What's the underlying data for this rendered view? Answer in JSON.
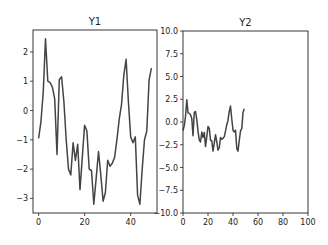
{
  "chart_data": [
    {
      "type": "line",
      "title": "Y1",
      "xlabel": "",
      "ylabel": "",
      "xlim": [
        -2.45,
        51.45
      ],
      "ylim": [
        -3.5,
        2.75
      ],
      "xticks": [
        0,
        20,
        40
      ],
      "yticks": [
        -3,
        -2,
        -1,
        0,
        1,
        2
      ],
      "grid": false,
      "legend": null,
      "series": [
        {
          "name": "Y1",
          "color": "#444444",
          "x": [
            0,
            1,
            2,
            3,
            4,
            5,
            6,
            7,
            8,
            9,
            10,
            11,
            12,
            13,
            14,
            15,
            16,
            17,
            18,
            19,
            20,
            21,
            22,
            23,
            24,
            25,
            26,
            27,
            28,
            29,
            30,
            31,
            32,
            33,
            34,
            35,
            36,
            37,
            38,
            39,
            40,
            41,
            42,
            43,
            44,
            45,
            46,
            47,
            48,
            49
          ],
          "values": [
            -0.95,
            -0.4,
            0.6,
            2.45,
            1.0,
            0.95,
            0.8,
            0.4,
            -1.5,
            1.05,
            1.15,
            0.3,
            -1.0,
            -2.0,
            -2.2,
            -1.1,
            -1.7,
            -1.15,
            -2.7,
            -1.6,
            -0.5,
            -0.7,
            -2.0,
            -2.05,
            -3.2,
            -2.3,
            -1.4,
            -2.2,
            -3.1,
            -2.8,
            -1.7,
            -1.9,
            -1.8,
            -1.6,
            -1.0,
            -0.3,
            0.2,
            1.2,
            1.75,
            0.3,
            -0.9,
            -1.1,
            -0.9,
            -2.9,
            -3.2,
            -2.0,
            -1.0,
            -0.7,
            1.05,
            1.45
          ]
        }
      ]
    },
    {
      "type": "line",
      "title": "Y2",
      "xlabel": "",
      "ylabel": "",
      "xlim": [
        0,
        100
      ],
      "ylim": [
        -10,
        10
      ],
      "xticks": [
        0,
        20,
        40,
        60,
        80,
        100
      ],
      "yticks": [
        -10.0,
        -7.5,
        -5.0,
        -2.5,
        0.0,
        2.5,
        5.0,
        7.5,
        10.0
      ],
      "grid": false,
      "legend": null,
      "series": [
        {
          "name": "Y2",
          "color": "#444444",
          "x": [
            0,
            1,
            2,
            3,
            4,
            5,
            6,
            7,
            8,
            9,
            10,
            11,
            12,
            13,
            14,
            15,
            16,
            17,
            18,
            19,
            20,
            21,
            22,
            23,
            24,
            25,
            26,
            27,
            28,
            29,
            30,
            31,
            32,
            33,
            34,
            35,
            36,
            37,
            38,
            39,
            40,
            41,
            42,
            43,
            44,
            45,
            46,
            47,
            48,
            49
          ],
          "values": [
            -0.95,
            -0.4,
            0.6,
            2.45,
            1.0,
            0.95,
            0.8,
            0.4,
            -1.5,
            1.05,
            1.15,
            0.3,
            -1.0,
            -2.0,
            -2.2,
            -1.1,
            -1.7,
            -1.15,
            -2.7,
            -1.6,
            -0.5,
            -0.7,
            -2.0,
            -2.05,
            -3.2,
            -2.3,
            -1.4,
            -2.2,
            -3.1,
            -2.8,
            -1.7,
            -1.9,
            -1.8,
            -1.6,
            -1.0,
            -0.3,
            0.2,
            1.2,
            1.75,
            0.3,
            -0.9,
            -1.1,
            -0.9,
            -2.9,
            -3.2,
            -2.0,
            -1.0,
            -0.7,
            1.05,
            1.45
          ]
        }
      ]
    }
  ],
  "layout": {
    "axes": [
      {
        "left": 33,
        "top": 30,
        "right": 157,
        "bottom": 213
      },
      {
        "left": 183,
        "top": 31,
        "right": 308,
        "bottom": 213
      }
    ],
    "colors": {
      "line": "#444444",
      "spine": "#222222",
      "text": "#222222",
      "background": "#ffffff"
    }
  }
}
